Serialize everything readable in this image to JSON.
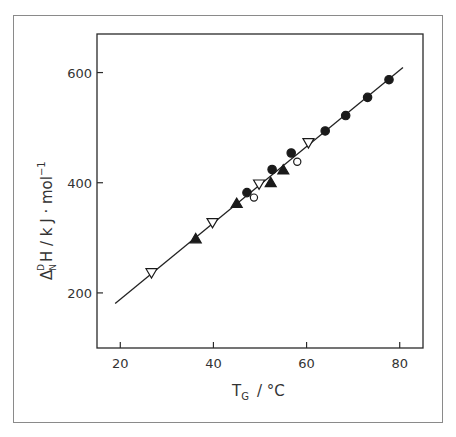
{
  "chart_data": {
    "type": "scatter",
    "title": "",
    "xlabel": "T_G / °C",
    "ylabel": "Δ_N^D H / kJ·mol⁻¹",
    "xlim": [
      15,
      85
    ],
    "ylim": [
      100,
      670
    ],
    "x_ticks": [
      20,
      40,
      60,
      80
    ],
    "y_ticks": [
      200,
      400,
      600
    ],
    "grid": false,
    "legend": null,
    "series": [
      {
        "name": "filled-circle",
        "marker": "circle",
        "filled": true,
        "points": [
          [
            47.2,
            382
          ],
          [
            52.6,
            424
          ],
          [
            56.7,
            454
          ],
          [
            64.0,
            494
          ],
          [
            68.4,
            522
          ],
          [
            73.1,
            555
          ],
          [
            77.7,
            587
          ]
        ]
      },
      {
        "name": "open-circle",
        "marker": "circle",
        "filled": false,
        "points": [
          [
            48.7,
            373
          ],
          [
            58.0,
            438
          ]
        ]
      },
      {
        "name": "filled-triangle-up",
        "marker": "triangle-up",
        "filled": true,
        "points": [
          [
            36.2,
            298
          ],
          [
            45.0,
            362
          ],
          [
            52.3,
            400
          ],
          [
            55.0,
            423
          ]
        ]
      },
      {
        "name": "open-triangle-down",
        "marker": "triangle-down",
        "filled": false,
        "points": [
          [
            26.7,
            237
          ],
          [
            39.8,
            328
          ],
          [
            49.8,
            398
          ],
          [
            60.4,
            473
          ]
        ]
      }
    ],
    "fit_line": {
      "x": [
        18.9,
        80.7
      ],
      "y": [
        181,
        609
      ]
    }
  },
  "axes": {
    "x_title_main": "T",
    "x_title_sub": "G",
    "x_title_unit": "/ °C",
    "y_title_main": "Δ",
    "y_title_sub": "N",
    "y_title_sup": "D",
    "y_title_rest": "H / k J · mol",
    "y_title_exp": "−1"
  }
}
